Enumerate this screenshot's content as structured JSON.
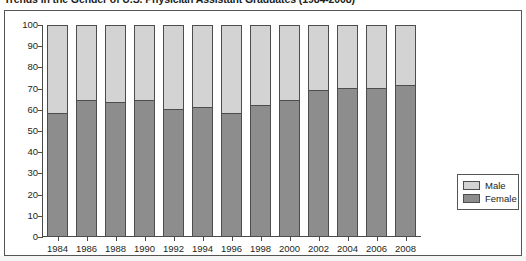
{
  "chart": {
    "title": "Trends in the Gender of U.S. Physician Assistant Graduates (1984-2008)"
  },
  "legend": {
    "position": "bottom-right",
    "items": [
      {
        "label": "Male",
        "color": "#d3d3d3"
      },
      {
        "label": "Female",
        "color": "#8d8d8d"
      }
    ]
  },
  "chart_data": {
    "type": "bar",
    "stacked": true,
    "title": "Trends in the Gender of U.S. Physician Assistant Graduates (1984-2008)",
    "xlabel": "",
    "ylabel": "",
    "ylim": [
      0,
      100
    ],
    "yticks": [
      0,
      10,
      20,
      30,
      40,
      50,
      60,
      70,
      80,
      90,
      100
    ],
    "ytick_labels": [
      "0",
      "10",
      "20",
      "30",
      "40",
      "50",
      "60",
      "70",
      "80",
      "90",
      "100"
    ],
    "grid": false,
    "categories": [
      "1984",
      "1986",
      "1988",
      "1990",
      "1992",
      "1994",
      "1996",
      "1998",
      "2000",
      "2002",
      "2004",
      "2006",
      "2008"
    ],
    "series": [
      {
        "name": "Female",
        "color": "#8d8d8d",
        "values": [
          58,
          64,
          63,
          64,
          60,
          61,
          58,
          62,
          64,
          69,
          70,
          70,
          71
        ]
      },
      {
        "name": "Male",
        "color": "#d3d3d3",
        "values": [
          42,
          36,
          37,
          36,
          40,
          39,
          42,
          38,
          36,
          31,
          30,
          30,
          29
        ]
      }
    ]
  }
}
